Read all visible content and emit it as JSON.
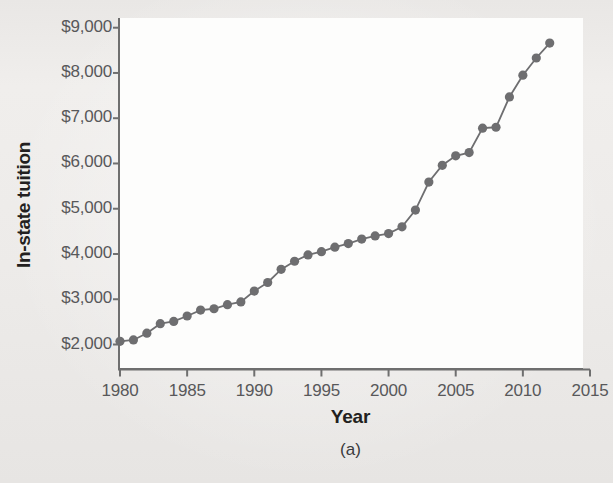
{
  "figure": {
    "caption": "(a)",
    "series_color": "#6e6e70",
    "axis_color": "#6f6f6f",
    "plot_background": "#fdfdfc",
    "page_background": "#eeecea"
  },
  "chart_data": {
    "type": "line",
    "title": "",
    "subtitle": "",
    "xlabel": "Year",
    "ylabel": "In-state tuition",
    "xlim": [
      1980,
      2015
    ],
    "ylim": [
      2000,
      9000
    ],
    "grid": false,
    "legend": null,
    "markers": "filled-circle",
    "xtick_labels": [
      "1980",
      "1985",
      "1990",
      "1995",
      "2000",
      "2005",
      "2010",
      "2015"
    ],
    "xticks": [
      1980,
      1985,
      1990,
      1995,
      2000,
      2005,
      2010,
      2015
    ],
    "ytick_labels": [
      "$2,000",
      "$3,000",
      "$4,000",
      "$5,000",
      "$6,000",
      "$7,000",
      "$8,000",
      "$9,000"
    ],
    "yticks": [
      2000,
      3000,
      4000,
      5000,
      6000,
      7000,
      8000,
      9000
    ],
    "x": [
      1980,
      1981,
      1982,
      1983,
      1984,
      1985,
      1986,
      1987,
      1988,
      1989,
      1990,
      1991,
      1992,
      1993,
      1994,
      1995,
      1996,
      1997,
      1998,
      1999,
      2000,
      2001,
      2002,
      2003,
      2004,
      2005,
      2006,
      2007,
      2008,
      2009,
      2010,
      2011,
      2012
    ],
    "values": [
      2070,
      2100,
      2250,
      2460,
      2510,
      2630,
      2760,
      2790,
      2880,
      2940,
      3180,
      3370,
      3660,
      3840,
      3980,
      4050,
      4150,
      4230,
      4330,
      4400,
      4450,
      4600,
      4970,
      5590,
      5960,
      6170,
      6240,
      6780,
      6800,
      7470,
      7950,
      8330,
      8660
    ],
    "series": [
      {
        "name": "In-state tuition",
        "color": "#6e6e70",
        "values": [
          2070,
          2100,
          2250,
          2460,
          2510,
          2630,
          2760,
          2790,
          2880,
          2940,
          3180,
          3370,
          3660,
          3840,
          3980,
          4050,
          4150,
          4230,
          4330,
          4400,
          4450,
          4600,
          4970,
          5590,
          5960,
          6170,
          6240,
          6780,
          6800,
          7470,
          7950,
          8330,
          8660
        ]
      }
    ]
  }
}
